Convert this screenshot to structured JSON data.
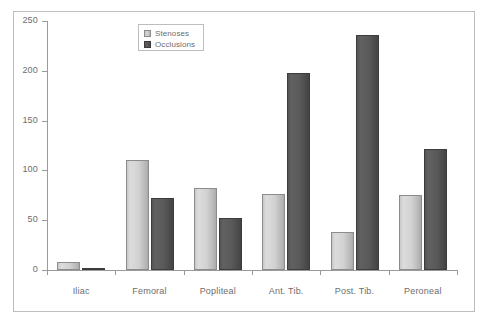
{
  "chart_data": {
    "type": "bar",
    "title": "",
    "subtitle": "",
    "xlabel": "",
    "ylabel": "",
    "categories": [
      "Iliac",
      "Femoral",
      "Popliteal",
      "Ant. Tib.",
      "Post. Tib.",
      "Peroneal"
    ],
    "series": [
      {
        "name": "Stenoses",
        "values": [
          8,
          110,
          82,
          76,
          38,
          75
        ]
      },
      {
        "name": "Occlusions",
        "values": [
          2,
          72,
          52,
          198,
          236,
          122
        ]
      }
    ],
    "ylim": [
      0,
      250
    ],
    "yticks": [
      0,
      50,
      100,
      150,
      200,
      250
    ],
    "ytick_labels": [
      "0",
      "50",
      "100",
      "150",
      "200",
      "250"
    ],
    "grid": false,
    "legend_position": "top-center",
    "colors": {
      "stenoses": "#d2d2d2",
      "occlusions": "#545454",
      "axis": "#9a9a9a",
      "text": "#6d6d6d",
      "frame": "#bdbdbd",
      "background": "#ffffff"
    }
  },
  "legend": {
    "items": [
      {
        "label": "Stenoses",
        "swatch": "legend-swatch-stenoses"
      },
      {
        "label": "Occlusions",
        "swatch": "legend-swatch-occlusions"
      }
    ]
  }
}
